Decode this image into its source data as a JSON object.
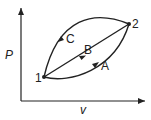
{
  "diagram": {
    "type": "P-v diagram",
    "axes": {
      "y_label": "P",
      "x_label": "v"
    },
    "points": [
      {
        "id": "1",
        "label": "1"
      },
      {
        "id": "2",
        "label": "2"
      }
    ],
    "paths": [
      {
        "id": "A",
        "label": "A",
        "from": "1",
        "to": "2",
        "shape": "lower curve"
      },
      {
        "id": "B",
        "label": "B",
        "from": "1",
        "to": "2",
        "shape": "straight line"
      },
      {
        "id": "C",
        "label": "C",
        "from": "2",
        "to": "1",
        "shape": "upper curve"
      }
    ],
    "colors": {
      "line": "#222222",
      "background": "#ffffff"
    }
  }
}
